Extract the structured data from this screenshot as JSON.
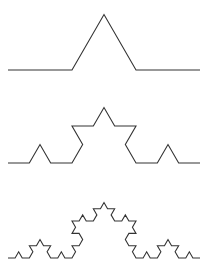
{
  "figure": {
    "background_color": "#ffffff",
    "width": 208,
    "height": 277,
    "stroke_color": "#333333",
    "stroke_width": 1.1
  },
  "chart_data": {
    "type": "line",
    "subtitle": "",
    "xlabel": "",
    "ylabel": "",
    "grid": false,
    "legend_position": "none",
    "axis_visible": false,
    "tick_labels_x": [],
    "tick_labels_y": [],
    "xlim": [
      0,
      208
    ],
    "ylim": [
      277,
      0
    ],
    "annotations": [],
    "construction": {
      "curve_family": "Koch curve (snowflake side)",
      "rule": "Replace each segment with four segments of one third length, middle pair forming an outward equilateral bump of 60 degrees",
      "start_x": 8,
      "end_x": 200,
      "span_width": 192,
      "angle_degrees": 60,
      "direction": "upward"
    },
    "series": [
      {
        "name": "iteration-1",
        "order": 1,
        "baseline_y": 70,
        "segment_count": 4,
        "segment_length": 64,
        "peak_height": 55.4,
        "peak_point": [
          104,
          14.6
        ],
        "vertices_x": [
          8,
          72,
          104,
          136,
          200
        ],
        "vertices_y": [
          70,
          70,
          14.6,
          70,
          70
        ]
      },
      {
        "name": "iteration-2",
        "order": 2,
        "baseline_y": 163,
        "segment_count": 16,
        "segment_length": 21.333,
        "peak_height": 55.4,
        "peak_point": [
          104,
          107.6
        ],
        "vertices_x": [
          8,
          72,
          104,
          136,
          200
        ],
        "vertices_y": [
          163,
          163,
          107.6,
          163,
          163
        ]
      },
      {
        "name": "iteration-3",
        "order": 3,
        "baseline_y": 258,
        "segment_count": 64,
        "segment_length": 7.111,
        "peak_height": 55.4,
        "peak_point": [
          104,
          202.6
        ],
        "vertices_x": [
          8,
          72,
          104,
          136,
          200
        ],
        "vertices_y": [
          258,
          258,
          202.6,
          258,
          258
        ]
      }
    ]
  }
}
